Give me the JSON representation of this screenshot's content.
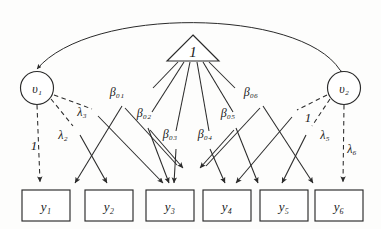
{
  "diagram": {
    "type": "path-diagram",
    "background_color": "#fdfdfc",
    "stroke_color": "#2a2a2a"
  },
  "latent_nodes": [
    {
      "id": "v1",
      "label": "υ₁",
      "shape": "circle",
      "cx": 37,
      "cy": 88,
      "r": 16
    },
    {
      "id": "v2",
      "label": "υ₂",
      "shape": "circle",
      "cx": 344,
      "cy": 88,
      "r": 16
    }
  ],
  "constant_node": {
    "id": "triangle-one",
    "label": "1",
    "shape": "triangle",
    "cx": 193,
    "cy": 52
  },
  "observed_nodes": [
    {
      "id": "y1",
      "label": "y₁",
      "x": 22,
      "y": 190,
      "w": 48,
      "h": 31
    },
    {
      "id": "y2",
      "label": "y₂",
      "x": 85,
      "y": 190,
      "w": 48,
      "h": 31
    },
    {
      "id": "y3",
      "label": "y₃",
      "x": 146,
      "y": 190,
      "w": 48,
      "h": 31
    },
    {
      "id": "y4",
      "label": "y₄",
      "x": 203,
      "y": 190,
      "w": 48,
      "h": 31
    },
    {
      "id": "y5",
      "label": "y₅",
      "x": 260,
      "y": 190,
      "w": 48,
      "h": 31
    },
    {
      "id": "y6",
      "label": "y₆",
      "x": 315,
      "y": 190,
      "w": 48,
      "h": 31
    }
  ],
  "beta_labels": [
    {
      "id": "b01",
      "label": "β₀₁",
      "x": 117,
      "y": 96
    },
    {
      "id": "b02",
      "label": "β₀₂",
      "x": 144,
      "y": 117
    },
    {
      "id": "b03",
      "label": "β₀₃",
      "x": 170,
      "y": 138
    },
    {
      "id": "b04",
      "label": "β₀₄",
      "x": 205,
      "y": 138
    },
    {
      "id": "b05",
      "label": "β₀₅",
      "x": 228,
      "y": 117
    },
    {
      "id": "b06",
      "label": "β₀₆",
      "x": 251,
      "y": 96
    }
  ],
  "lambda_labels": [
    {
      "id": "load1",
      "label": "1",
      "x": 34,
      "y": 145
    },
    {
      "id": "lam2",
      "label": "λ₂",
      "x": 63,
      "y": 136
    },
    {
      "id": "lam3",
      "label": "λ₃",
      "x": 80,
      "y": 113
    },
    {
      "id": "load1r",
      "label": "1",
      "x": 308,
      "y": 118
    },
    {
      "id": "lam5",
      "label": "λ₅",
      "x": 327,
      "y": 135
    },
    {
      "id": "lam6",
      "label": "λ₆",
      "x": 351,
      "y": 150
    }
  ],
  "covariance_arc": {
    "id": "v1-v2-covariance",
    "style": "curved-double-arrow",
    "from": "v1",
    "to": "v2"
  },
  "edges_solid_from_constant": [
    {
      "from": "triangle-one",
      "to": "y1"
    },
    {
      "from": "triangle-one",
      "to": "y2"
    },
    {
      "from": "triangle-one",
      "to": "y3"
    },
    {
      "from": "triangle-one",
      "to": "y4"
    },
    {
      "from": "triangle-one",
      "to": "y5"
    },
    {
      "from": "triangle-one",
      "to": "y6"
    }
  ],
  "edges_dashed_from_latents": [
    {
      "from": "v1",
      "to": "y1",
      "label": "1"
    },
    {
      "from": "v1",
      "to": "y2",
      "label": "λ₂"
    },
    {
      "from": "v1",
      "to": "y3",
      "label": "λ₃"
    },
    {
      "from": "v2",
      "to": "y4",
      "label": "1"
    },
    {
      "from": "v2",
      "to": "y5",
      "label": "λ₅"
    },
    {
      "from": "v2",
      "to": "y6",
      "label": "λ₆"
    }
  ]
}
